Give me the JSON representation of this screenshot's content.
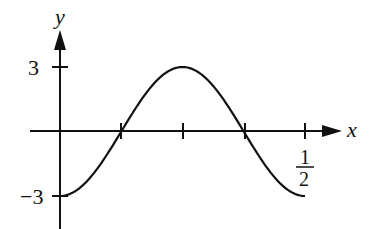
{
  "chart_data": {
    "type": "line",
    "title": "",
    "xlabel": "x",
    "ylabel": "y",
    "function": "y = -3cos(4πx)",
    "x_ticks": [
      {
        "value": 0.125,
        "label": ""
      },
      {
        "value": 0.25,
        "label": ""
      },
      {
        "value": 0.375,
        "label": ""
      },
      {
        "value": 0.5,
        "label": "1/2"
      }
    ],
    "y_ticks": [
      {
        "value": 3,
        "label": "3"
      },
      {
        "value": -3,
        "label": "−3"
      }
    ],
    "xlim": [
      0,
      0.5
    ],
    "ylim": [
      -3,
      3
    ],
    "grid": false,
    "series": [
      {
        "name": "curve",
        "x": [
          0,
          0.0625,
          0.125,
          0.1875,
          0.25,
          0.3125,
          0.375,
          0.4375,
          0.5
        ],
        "y": [
          -3,
          -2.12,
          0,
          2.12,
          3,
          2.12,
          0,
          -2.12,
          -3
        ]
      }
    ]
  },
  "labels": {
    "x_axis": "x",
    "y_axis": "y",
    "y_tick_pos": "3",
    "y_tick_neg": "−3",
    "x_tick_half_num": "1",
    "x_tick_half_den": "2"
  }
}
